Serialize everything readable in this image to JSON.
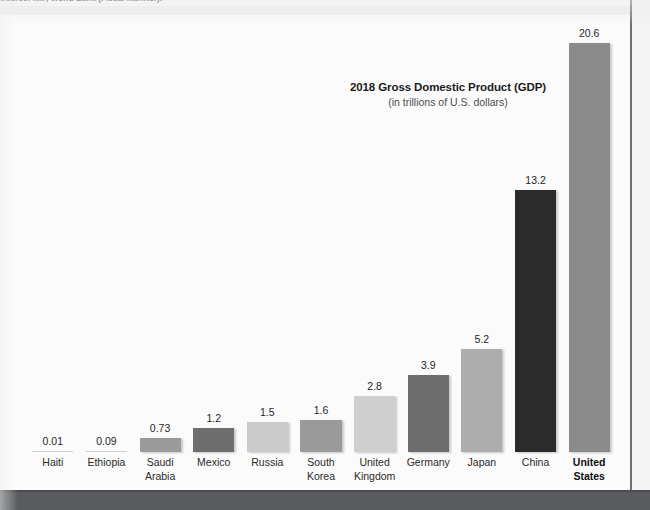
{
  "page": {
    "source_note": "Source: IMF, World Bank (Fiscal monitor)."
  },
  "chart_data": {
    "type": "bar",
    "title": "2018 Gross Domestic Product (GDP)",
    "subtitle": "(in trillions of U.S. dollars)",
    "xlabel": "",
    "ylabel": "",
    "ylim": [
      0,
      22
    ],
    "grid": false,
    "legend": null,
    "units": "trillions of U.S. dollars",
    "categories": [
      "Haiti",
      "Ethiopia",
      "Saudi Arabia",
      "Mexico",
      "Russia",
      "South Korea",
      "United Kingdom",
      "Germany",
      "Japan",
      "China",
      "United States"
    ],
    "category_lines": [
      [
        "Haiti"
      ],
      [
        "Ethiopia"
      ],
      [
        "Saudi",
        "Arabia"
      ],
      [
        "Mexico"
      ],
      [
        "Russia"
      ],
      [
        "South",
        "Korea"
      ],
      [
        "United",
        "Kingdom"
      ],
      [
        "Germany"
      ],
      [
        "Japan"
      ],
      [
        "China"
      ],
      [
        "United",
        "States"
      ]
    ],
    "values": [
      0.01,
      0.09,
      0.73,
      1.2,
      1.5,
      1.6,
      2.8,
      3.9,
      5.2,
      13.2,
      20.6
    ],
    "value_labels": [
      "0.01",
      "0.09",
      "0.73",
      "1.2",
      "1.5",
      "1.6",
      "2.8",
      "3.9",
      "5.2",
      "13.2",
      "20.6"
    ],
    "bar_colors": [
      "#cfcfcf",
      "#cfcfcf",
      "#9a9a9a",
      "#6e6e6e",
      "#cbcbcb",
      "#9a9a9a",
      "#cfcfcf",
      "#6e6e6e",
      "#adadad",
      "#2b2b2b",
      "#8b8b8b"
    ],
    "emphasized_category": "United States"
  },
  "colors": {
    "page_background": "#fbfbfb",
    "bottom_band": "#595b5e",
    "rule": "#6d6f72",
    "title_text": "#1b1b1b",
    "subtitle_text": "#4d4d4d",
    "label_text": "#2a2a2a"
  }
}
